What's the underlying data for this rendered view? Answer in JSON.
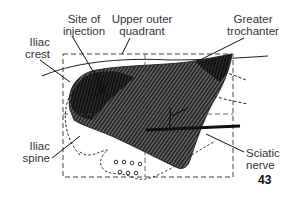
{
  "figure": {
    "number": "43"
  },
  "labels": {
    "site_of_injection": [
      "Site of",
      "injection"
    ],
    "upper_outer_quadrant": [
      "Upper outer",
      "quadrant"
    ],
    "greater_trochanter": [
      "Greater",
      "trochanter"
    ],
    "iliac_crest": [
      "Iliac",
      "crest"
    ],
    "iliac_spine": [
      "Iliac",
      "spine"
    ],
    "sciatic_nerve": [
      "Sciatic",
      "nerve"
    ]
  },
  "colors": {
    "ink": "#222222",
    "muscle_dark": "#1a1a1a",
    "muscle_mid": "#555555",
    "label_text": "#333333",
    "background": "#ffffff"
  }
}
